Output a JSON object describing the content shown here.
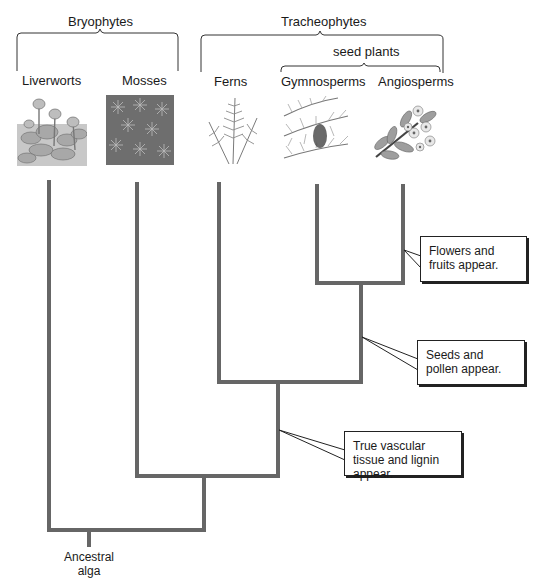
{
  "groups": {
    "bryophytes": "Bryophytes",
    "tracheophytes": "Tracheophytes",
    "seed_plants": "seed plants"
  },
  "taxa": [
    {
      "name": "Liverworts",
      "icon": "liverwort-illustration"
    },
    {
      "name": "Mosses",
      "icon": "moss-illustration"
    },
    {
      "name": "Ferns",
      "icon": "fern-illustration"
    },
    {
      "name": "Gymnosperms",
      "icon": "gymnosperm-illustration"
    },
    {
      "name": "Angiosperms",
      "icon": "angiosperm-illustration"
    }
  ],
  "callouts": {
    "flowers": "Flowers and fruits appear.",
    "seeds": "Seeds and pollen appear.",
    "vascular": "True vascular tissue and lignin appear."
  },
  "root": {
    "line1": "Ancestral",
    "line2": "alga"
  },
  "colors": {
    "branch": "#666666",
    "text": "#1a1a1a",
    "bracket": "#333333"
  }
}
